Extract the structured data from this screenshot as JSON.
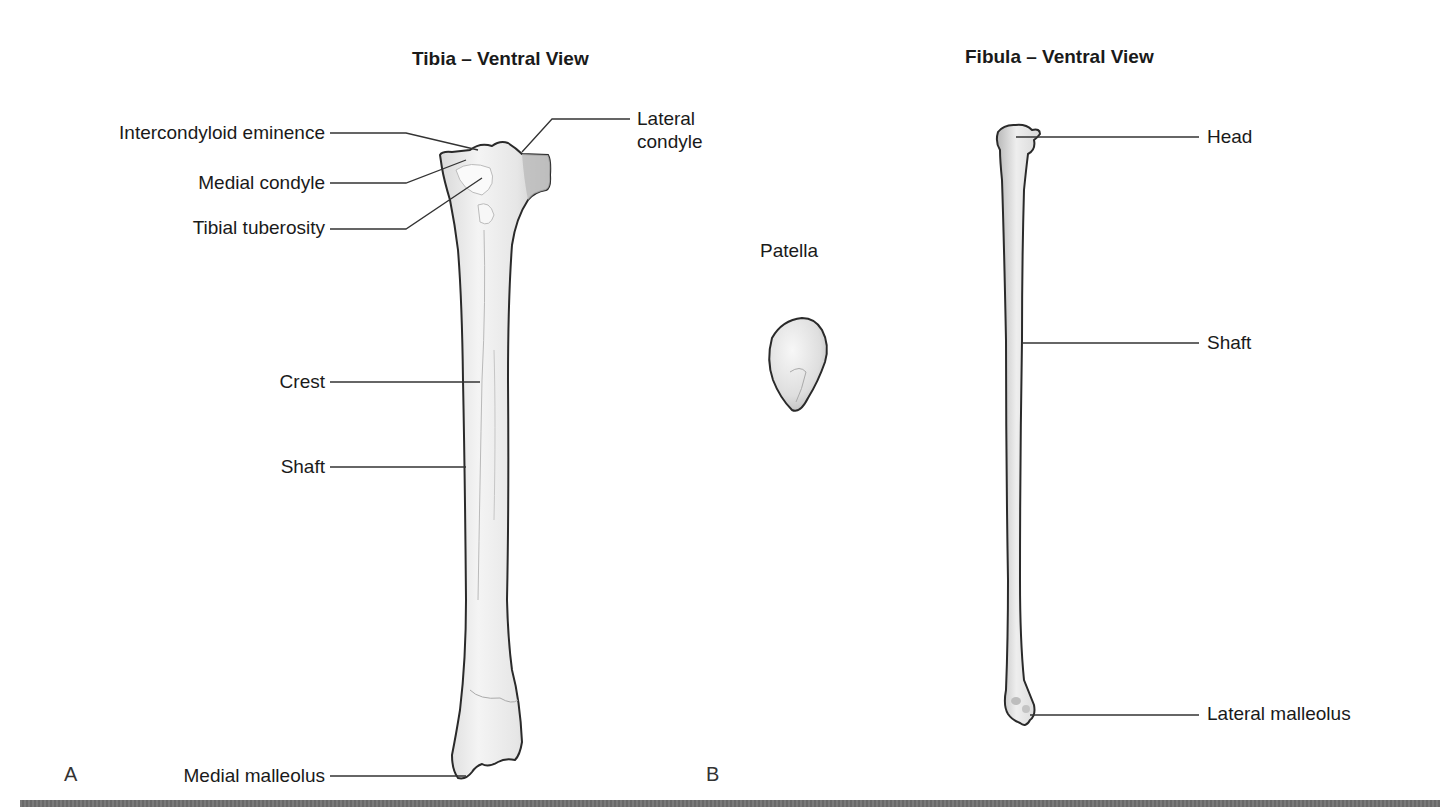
{
  "panels": {
    "tibia": {
      "letter": "A",
      "title": "Tibia – Ventral View",
      "labels": {
        "intercondyloid_eminence": "Intercondyloid eminence",
        "lateral_condyle_line1": "Lateral",
        "lateral_condyle_line2": "condyle",
        "medial_condyle": "Medial condyle",
        "tibial_tuberosity": "Tibial tuberosity",
        "crest": "Crest",
        "shaft": "Shaft",
        "medial_malleolus": "Medial malleolus"
      }
    },
    "patella": {
      "label": "Patella"
    },
    "fibula": {
      "letter": "B",
      "title": "Fibula – Ventral View",
      "labels": {
        "head": "Head",
        "shaft": "Shaft",
        "lateral_malleolus": "Lateral malleolus"
      }
    }
  },
  "colors": {
    "bone_fill": "#ececec",
    "bone_shade": "#c8c8c8",
    "outline": "#2a2a2a",
    "leader_line": "#333333",
    "text": "#1a1a1a"
  }
}
